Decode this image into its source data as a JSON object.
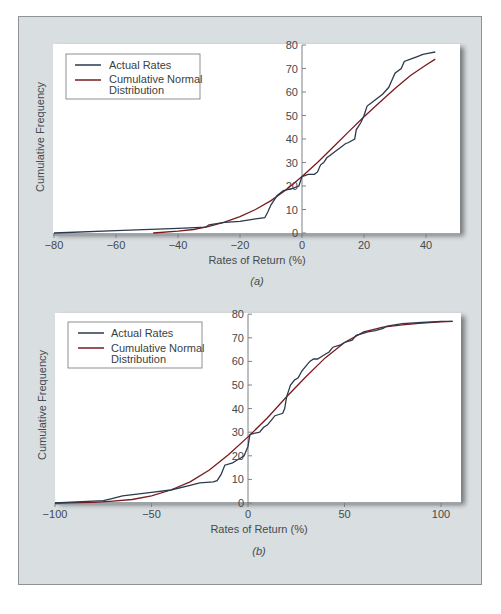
{
  "colors": {
    "panel_bg": "#d9dee1",
    "plot_bg": "#ffffff",
    "actual": "#2b3a4e",
    "normal": "#7a1a1f",
    "axis": "#6b7075"
  },
  "chart_data": [
    {
      "type": "line",
      "panel_label": "(a)",
      "xlabel": "Rates of Return (%)",
      "ylabel": "Cumulative Frequency",
      "xlim": [
        -80,
        50
      ],
      "ylim": [
        0,
        80
      ],
      "xticks": [
        -80,
        -60,
        -40,
        -20,
        0,
        20,
        40
      ],
      "yticks": [
        0,
        10,
        20,
        30,
        40,
        50,
        60,
        70,
        80
      ],
      "legend": [
        "Actual Rates",
        "Cumulative Normal Distribution"
      ],
      "legend_position": "upper left",
      "grid": false,
      "series": [
        {
          "name": "Actual Rates",
          "x": [
            -80,
            -60,
            -40,
            -31,
            -30,
            -25,
            -20,
            -15,
            -12,
            -11,
            -10,
            -8,
            -6,
            -3,
            -1,
            0,
            2,
            4,
            5,
            6,
            7,
            8,
            9,
            11,
            12,
            14,
            15,
            17,
            17.5,
            18,
            19,
            20,
            21,
            22,
            24,
            26,
            28,
            29,
            30,
            32,
            33,
            35,
            37,
            39,
            41,
            43
          ],
          "y": [
            0,
            1,
            2,
            2.5,
            3.5,
            4.5,
            5,
            6,
            6.5,
            9,
            12,
            16,
            18,
            19,
            20,
            24,
            25,
            25,
            26,
            29,
            30,
            32,
            33,
            35,
            36,
            38,
            38.5,
            40,
            44,
            45,
            47,
            50,
            54,
            55,
            57,
            59,
            62,
            65,
            68,
            70,
            73,
            74,
            75,
            76,
            76.5,
            77
          ]
        },
        {
          "name": "Cumulative Normal Distribution",
          "x": [
            -48,
            -40,
            -35,
            -30,
            -25,
            -20,
            -15,
            -10,
            -5,
            0,
            5,
            10,
            15,
            20,
            25,
            30,
            35,
            40,
            43
          ],
          "y": [
            0,
            0.8,
            1.5,
            2.8,
            4.6,
            7,
            10,
            13.8,
            18.5,
            24,
            30,
            36.5,
            43,
            49.5,
            55.5,
            61.5,
            67,
            71.5,
            74
          ]
        }
      ]
    },
    {
      "type": "line",
      "panel_label": "(b)",
      "xlabel": "Rates of Return (%)",
      "ylabel": "Cumulative Frequency",
      "xlim": [
        -100,
        110
      ],
      "ylim": [
        0,
        80
      ],
      "xticks": [
        -100,
        -50,
        0,
        50,
        100
      ],
      "yticks": [
        0,
        10,
        20,
        30,
        40,
        50,
        60,
        70,
        80
      ],
      "legend": [
        "Actual Rates",
        "Cumulative Normal Distribution"
      ],
      "legend_position": "upper left",
      "grid": false,
      "series": [
        {
          "name": "Actual Rates",
          "x": [
            -100,
            -75,
            -70,
            -65,
            -50,
            -40,
            -30,
            -25,
            -18,
            -16,
            -14,
            -12,
            -8,
            -6,
            -4,
            -2,
            0,
            1,
            3,
            6,
            8,
            10,
            12,
            14,
            16,
            18,
            19,
            20,
            22,
            24,
            26,
            28,
            30,
            32,
            34,
            36,
            38,
            40,
            42,
            44,
            48,
            50,
            54,
            56,
            60,
            62,
            66,
            70,
            72,
            80,
            90,
            100,
            106
          ],
          "y": [
            0,
            1,
            2,
            3,
            4.5,
            5.5,
            7.5,
            8.5,
            9,
            9.5,
            12,
            16,
            17,
            18,
            19,
            20,
            24,
            29,
            29.5,
            30,
            32,
            33,
            35,
            37,
            37.5,
            38,
            40,
            45,
            50,
            52,
            53,
            56,
            58,
            60,
            61,
            61,
            62,
            63,
            64,
            66,
            67,
            68,
            69,
            71,
            72,
            72.5,
            73,
            74,
            75,
            76,
            76.5,
            77,
            77
          ]
        },
        {
          "name": "Cumulative Normal Distribution",
          "x": [
            -100,
            -80,
            -70,
            -60,
            -50,
            -40,
            -30,
            -20,
            -10,
            0,
            10,
            20,
            30,
            40,
            50,
            60,
            70,
            80,
            90,
            100,
            106
          ],
          "y": [
            0,
            0.3,
            0.8,
            1.5,
            3,
            5.5,
            9,
            14,
            20.5,
            28,
            36,
            45,
            53.5,
            61.5,
            68,
            72.5,
            74.5,
            75.5,
            76.2,
            76.8,
            77
          ]
        }
      ]
    }
  ],
  "figure": {
    "a": {
      "caption": "(a)",
      "xlabel": "Rates of Return (%)",
      "ylabel": "Cumulative Frequency",
      "legend_actual": "Actual Rates",
      "legend_normal_1": "Cumulative Normal",
      "legend_normal_2": "Distribution",
      "xtick_labels": [
        "−80",
        "−60",
        "−40",
        "−20",
        "0",
        "20",
        "40"
      ],
      "ytick_labels": [
        "0",
        "10",
        "20",
        "30",
        "40",
        "50",
        "60",
        "70",
        "80"
      ]
    },
    "b": {
      "caption": "(b)",
      "xlabel": "Rates of Return (%)",
      "ylabel": "Cumulative Frequency",
      "legend_actual": "Actual Rates",
      "legend_normal_1": "Cumulative Normal",
      "legend_normal_2": "Distribution",
      "xtick_labels": [
        "−100",
        "−50",
        "0",
        "50",
        "100"
      ],
      "ytick_labels": [
        "0",
        "10",
        "20",
        "30",
        "40",
        "50",
        "60",
        "70",
        "80"
      ]
    }
  }
}
